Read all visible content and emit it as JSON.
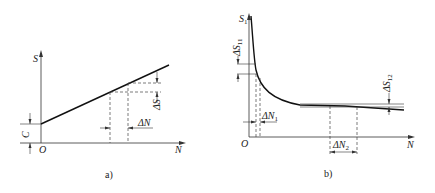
{
  "figure": {
    "panels": [
      {
        "id": "a",
        "caption": "a)",
        "y_axis_label": "S",
        "x_axis_label": "N",
        "origin_label": "O",
        "intercept_label": "C",
        "delta_s_label": "ΔS",
        "delta_n_label": "ΔN",
        "description": "Linear growth of S with N starting from intercept C"
      },
      {
        "id": "b",
        "caption": "b)",
        "y_axis_label": "S",
        "y_axis_sub": "1",
        "x_axis_label": "N",
        "origin_label": "O",
        "delta_s1_label": "ΔS",
        "delta_s1_sub": "11",
        "delta_s2_label": "ΔS",
        "delta_s2_sub": "12",
        "delta_n1_label": "ΔN",
        "delta_n1_sub": "1",
        "delta_n2_label": "ΔN",
        "delta_n2_sub": "2",
        "description": "Decaying S1 with N approaching a near-constant slowly-declining asymptote"
      }
    ]
  }
}
